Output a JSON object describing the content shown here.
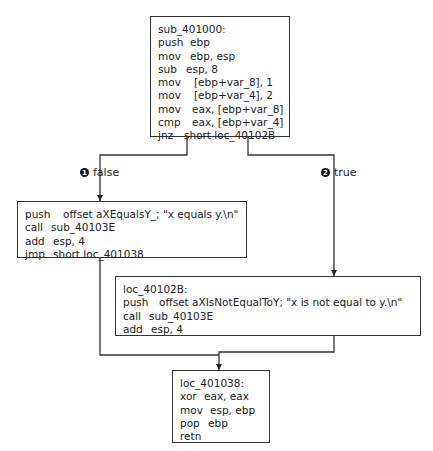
{
  "blocks": {
    "entry": {
      "lines": [
        {
          "op": "sub_401000:",
          "args": ""
        },
        {
          "op": "push",
          "args": "ebp"
        },
        {
          "op": "mov",
          "args": "ebp, esp"
        },
        {
          "op": "sub",
          "args": "esp, 8"
        },
        {
          "op": "mov",
          "args": "[ebp+var_8], 1"
        },
        {
          "op": "mov",
          "args": "[ebp+var_4], 2"
        },
        {
          "op": "mov",
          "args": "eax, [ebp+var_8]"
        },
        {
          "op": "cmp",
          "args": "eax, [ebp+var_4]"
        },
        {
          "op": "jnz",
          "args": "short loc_40102B"
        }
      ]
    },
    "false_block": {
      "lines": [
        {
          "op": "push",
          "args": "offset aXEqualsY_; \"x equals y.\\n\""
        },
        {
          "op": "call",
          "args": "sub_40103E"
        },
        {
          "op": "add",
          "args": "esp, 4"
        },
        {
          "op": "jmp",
          "args": "short loc_401038"
        }
      ]
    },
    "true_block": {
      "lines": [
        {
          "op": "loc_40102B:",
          "args": ""
        },
        {
          "op": "push",
          "args": "offset aXIsNotEqualToY; \"x is not equal to y.\\n\""
        },
        {
          "op": "call",
          "args": "sub_40103E"
        },
        {
          "op": "add",
          "args": "esp, 4"
        }
      ]
    },
    "exit": {
      "lines": [
        {
          "op": "loc_401038:",
          "args": ""
        },
        {
          "op": "xor",
          "args": "eax, eax"
        },
        {
          "op": "mov",
          "args": "esp, ebp"
        },
        {
          "op": "pop",
          "args": "ebp"
        },
        {
          "op": "retn",
          "args": ""
        }
      ]
    }
  },
  "edges": {
    "false": {
      "marker": "1",
      "label": "false"
    },
    "true": {
      "marker": "2",
      "label": "true"
    }
  }
}
